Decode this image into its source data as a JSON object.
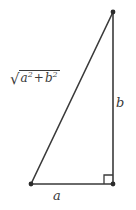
{
  "figure": {
    "kind": "right-triangle-diagram",
    "background_color": "#ffffff",
    "stroke_color": "#3a3a3a",
    "width": 136,
    "height": 210
  },
  "labels": {
    "base_label": "a",
    "vertical_label": "b",
    "hypotenuse": {
      "radical_sign": "√",
      "term1_base": "a",
      "term1_exponent": "2",
      "operator": "+",
      "term2_base": "b",
      "term2_exponent": "2",
      "plain_text": "√(a² + b²)"
    }
  },
  "geometry": {
    "vertices": {
      "top": {
        "x": 113,
        "y": 12
      },
      "bottom_left": {
        "x": 31,
        "y": 184
      },
      "bottom_right": {
        "x": 113,
        "y": 184
      }
    },
    "right_angle_corner": "bottom_right",
    "right_angle_marker_size": 9,
    "vertex_dot_radius": 2.4,
    "line_width": 1.6
  }
}
